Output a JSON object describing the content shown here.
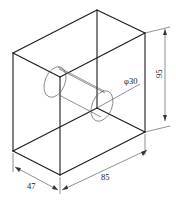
{
  "drawing": {
    "type": "isometric box with through hole",
    "stroke_color": "#1a1a1a",
    "background": "#ffffff"
  },
  "dimensions": {
    "depth": {
      "label": "47"
    },
    "width": {
      "label": "85"
    },
    "height": {
      "label": "95"
    },
    "hole_diameter": {
      "label": "φ30"
    }
  },
  "vertices": {
    "top_left": [
      13,
      53
    ],
    "top_back": [
      97,
      10
    ],
    "top_right": [
      145,
      33
    ],
    "top_front": [
      60,
      77
    ],
    "bottom_left": [
      13,
      151
    ],
    "bottom_front": [
      60,
      175
    ],
    "bottom_right": [
      145,
      132
    ],
    "hidden_back": [
      97,
      108
    ]
  }
}
